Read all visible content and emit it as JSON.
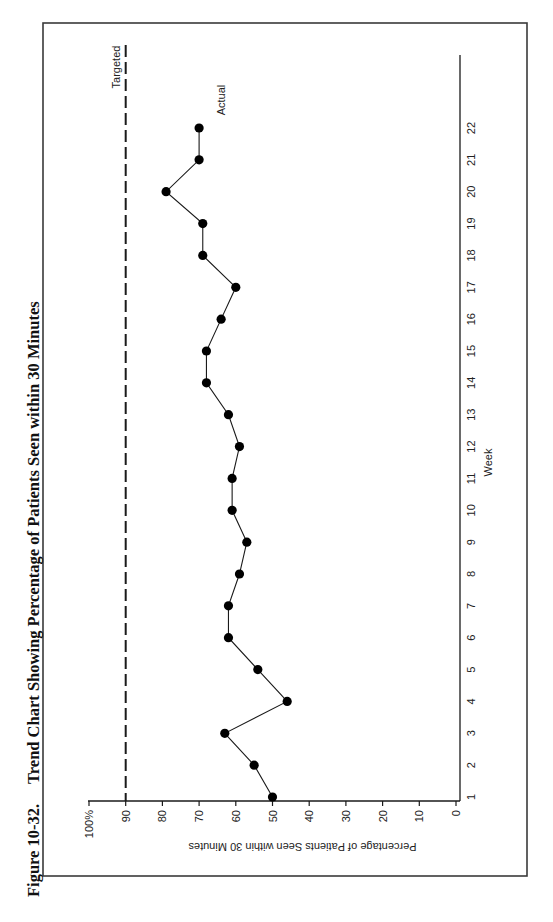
{
  "figure": {
    "number": "Figure 10-32.",
    "title": "Trend Chart Showing Percentage of Patients Seen within 30 Minutes"
  },
  "colors": {
    "ink": "#1a1a1a",
    "border": "#3a3a3a",
    "background": "#ffffff"
  },
  "chart_data": {
    "type": "line",
    "title": "Trend Chart Showing Percentage of Patients Seen within 30 Minutes",
    "figure_label": "Figure 10-32.",
    "xlabel": "Week",
    "ylabel": "Percentage of Patients Seen within 30 Minutes",
    "orientation": "rotated 90 degrees counter-clockwise on page",
    "x": [
      1,
      2,
      3,
      4,
      5,
      6,
      7,
      8,
      9,
      10,
      11,
      12,
      13,
      14,
      15,
      16,
      17,
      18,
      19,
      20,
      21,
      22
    ],
    "x_tick_labels": [
      "1",
      "2",
      "3",
      "4",
      "5",
      "6",
      "7",
      "8",
      "9",
      "10",
      "11",
      "12",
      "13",
      "14",
      "15",
      "16",
      "17",
      "18",
      "19",
      "20",
      "21",
      "22"
    ],
    "y_tick_labels": [
      "0",
      "10",
      "20",
      "30",
      "40",
      "50",
      "60",
      "70",
      "80",
      "90",
      "100%"
    ],
    "y_ticks": [
      0,
      10,
      20,
      30,
      40,
      50,
      60,
      70,
      80,
      90,
      100
    ],
    "ylim": [
      0,
      100
    ],
    "xlim": [
      1,
      22
    ],
    "grid": false,
    "series": [
      {
        "name": "Actual",
        "style": "solid line with filled circle markers",
        "values": [
          50,
          55,
          63,
          46,
          54,
          62,
          62,
          59,
          57,
          61,
          61,
          59,
          62,
          68,
          68,
          64,
          60,
          69,
          69,
          79,
          70,
          70
        ]
      },
      {
        "name": "Targeted",
        "style": "dashed horizontal line",
        "values": [
          90,
          90,
          90,
          90,
          90,
          90,
          90,
          90,
          90,
          90,
          90,
          90,
          90,
          90,
          90,
          90,
          90,
          90,
          90,
          90,
          90,
          90
        ]
      }
    ],
    "annotations": [
      {
        "text": "Targeted",
        "attached_to": "Targeted series"
      },
      {
        "text": "Actual",
        "attached_to": "Actual series, near week 22"
      }
    ]
  },
  "layout": {
    "border": {
      "left": 43,
      "top": 23,
      "right": 527,
      "bottom": 876
    },
    "value_axis": {
      "px_at_0": 456,
      "px_at_100": 89,
      "line_y": 801
    },
    "week_axis": {
      "line_x": 460,
      "px_week1": 797,
      "px_week22": 128,
      "top": 55
    },
    "target_line": {
      "y_start": 45
    }
  }
}
